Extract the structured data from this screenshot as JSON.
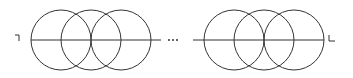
{
  "diagram": {
    "stroke_color": "#333333",
    "background": "#ffffff",
    "axis_y": 40,
    "radius": 30,
    "left_group": {
      "circle_centers_x": [
        61,
        91,
        121
      ],
      "line": {
        "x1": 31,
        "x2": 161
      }
    },
    "ellipsis": {
      "dots_x": [
        169,
        173,
        177
      ],
      "label": "..."
    },
    "right_group": {
      "circle_centers_x": [
        234,
        264,
        294
      ],
      "line": {
        "x1": 193,
        "x2": 324
      }
    },
    "left_end_mark": {
      "symbol": "¬",
      "points": "15,35 19,35 19,41"
    },
    "right_end_mark": {
      "symbol": "L",
      "points": "329,35 329,41 335,41"
    }
  }
}
